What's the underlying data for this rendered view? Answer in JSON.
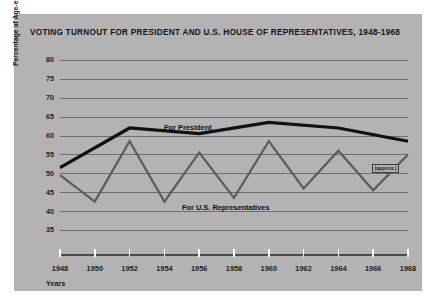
{
  "figure": {
    "title": "VOTING TURNOUT FOR PRESIDENT AND U.S. HOUSE OF REPRESENTATIVES, 1948-1968",
    "background_color": "#b3b3b3",
    "page_color": "#ffffff"
  },
  "annotations": {
    "approx_note": "(approx.)"
  },
  "chart_data": {
    "type": "line",
    "title": "VOTING TURNOUT FOR PRESIDENT AND U.S. HOUSE OF REPRESENTATIVES, 1948-1968",
    "xlabel": "Years",
    "ylabel": "Percentage of Age-eligible Voters Voting",
    "x": [
      1948,
      1950,
      1952,
      1954,
      1956,
      1958,
      1960,
      1962,
      1964,
      1966,
      1968
    ],
    "xtick_labels": [
      "1948",
      "1950",
      "1952",
      "1954",
      "1956",
      "1958",
      "1960",
      "1962",
      "1964",
      "1966",
      "1968"
    ],
    "ytick_labels": [
      "80",
      "75",
      "70",
      "65",
      "60",
      "55",
      "50",
      "45",
      "40",
      "35"
    ],
    "yticks": [
      80,
      75,
      70,
      65,
      60,
      55,
      50,
      45,
      40,
      35
    ],
    "ylim": [
      35,
      80
    ],
    "xlim": [
      1948,
      1968
    ],
    "grid": true,
    "legend": "inline-labels",
    "series": [
      {
        "name": "For President",
        "color": "#111111",
        "line_width": 3,
        "x": [
          1948,
          1952,
          1956,
          1960,
          1964,
          1968
        ],
        "values": [
          51.5,
          62.0,
          60.5,
          63.5,
          62.0,
          58.5
        ]
      },
      {
        "name": "For U.S. Representatives",
        "color": "#5c5c5c",
        "line_width": 2,
        "x": [
          1948,
          1950,
          1952,
          1954,
          1956,
          1958,
          1960,
          1962,
          1964,
          1966,
          1968
        ],
        "values": [
          49.5,
          42.5,
          58.5,
          42.5,
          55.5,
          43.5,
          58.5,
          46.0,
          56.0,
          45.5,
          55.0
        ]
      }
    ],
    "annotations": [
      {
        "text": "(approx.)",
        "x": 1966,
        "y": 48.5
      }
    ]
  }
}
